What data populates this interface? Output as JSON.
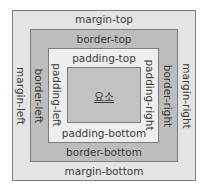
{
  "diagram": {
    "layers": {
      "margin": {
        "top": "margin-top",
        "bottom": "margin-bottom",
        "left": "margin-left",
        "right": "margin-right",
        "color": "#e4e4e4"
      },
      "border": {
        "top": "border-top",
        "bottom": "border-bottom",
        "left": "border-left",
        "right": "border-right",
        "color": "#bdbdbd"
      },
      "padding": {
        "top": "padding-top",
        "bottom": "padding-bottom",
        "left": "padding-left",
        "right": "padding-right",
        "color": "#eeeeee"
      },
      "content": {
        "label": "요소",
        "color": "#c2c2c2"
      }
    },
    "outline_color": "#7d7d7d"
  }
}
